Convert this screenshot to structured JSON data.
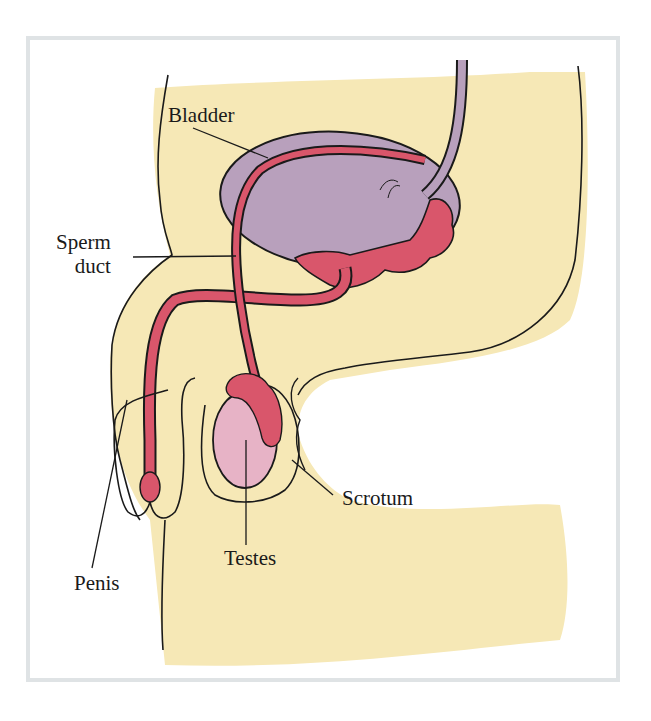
{
  "diagram": {
    "labels": {
      "bladder": "Bladder",
      "sperm_duct_line1": "Sperm",
      "sperm_duct_line2": "duct",
      "scrotum": "Scrotum",
      "testes": "Testes",
      "penis": "Penis"
    },
    "colors": {
      "body": "#f6e8b6",
      "bladder": "#b8a0bc",
      "duct": "#d9566b",
      "testis": "#e7b3c6",
      "outline": "#1a1a1a",
      "frame": "#dfe3e5"
    }
  }
}
